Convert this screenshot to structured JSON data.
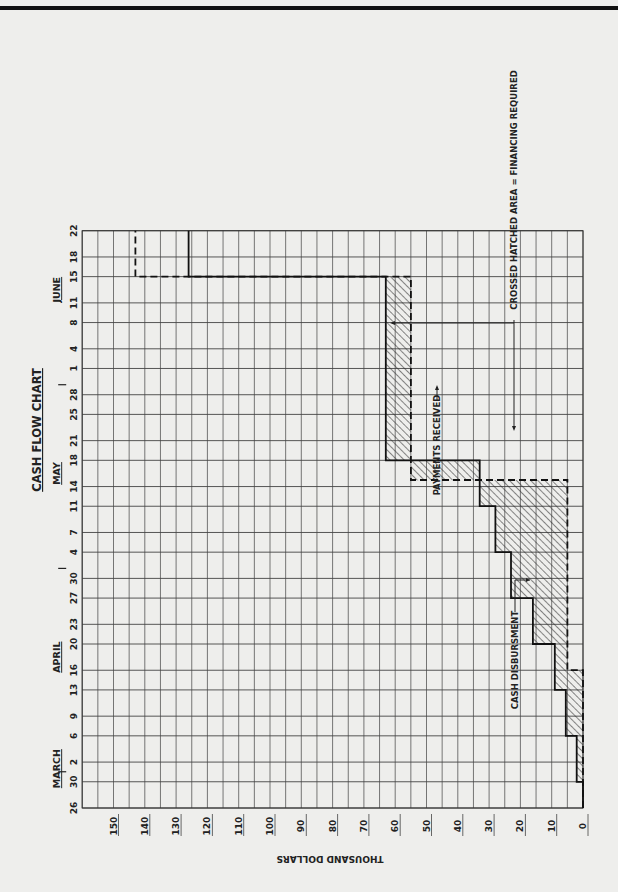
{
  "page": {
    "orientation": "rotated 90 degrees clockwise",
    "background": "#eeeeec",
    "ink": "#222222"
  },
  "chart_data": {
    "type": "line",
    "subtype": "step",
    "title": "CASH FLOW CHART",
    "xlabel": "",
    "ylabel": "THOUSAND DOLLARS",
    "ylim": [
      0,
      160
    ],
    "y_ticks": [
      0,
      10,
      20,
      30,
      40,
      50,
      60,
      70,
      80,
      90,
      100,
      110,
      120,
      130,
      140,
      150
    ],
    "months": [
      {
        "label": "MARCH",
        "near": "Mar 30"
      },
      {
        "label": "APRIL",
        "near": "Apr 16"
      },
      {
        "label": "MAY",
        "near": "May 18"
      },
      {
        "label": "JUNE",
        "near": "Jun 11"
      }
    ],
    "x_ticks": [
      {
        "label": "26",
        "date": "Mar 26",
        "day": 0
      },
      {
        "label": "30",
        "date": "Mar 30",
        "day": 4
      },
      {
        "label": "2",
        "date": "Apr 2",
        "day": 7
      },
      {
        "label": "6",
        "date": "Apr 6",
        "day": 11
      },
      {
        "label": "9",
        "date": "Apr 9",
        "day": 14
      },
      {
        "label": "13",
        "date": "Apr 13",
        "day": 18
      },
      {
        "label": "16",
        "date": "Apr 16",
        "day": 21
      },
      {
        "label": "20",
        "date": "Apr 20",
        "day": 25
      },
      {
        "label": "23",
        "date": "Apr 23",
        "day": 28
      },
      {
        "label": "27",
        "date": "Apr 27",
        "day": 32
      },
      {
        "label": "30",
        "date": "Apr 30",
        "day": 35
      },
      {
        "label": "4",
        "date": "May 4",
        "day": 39
      },
      {
        "label": "7",
        "date": "May 7",
        "day": 42
      },
      {
        "label": "11",
        "date": "May 11",
        "day": 46
      },
      {
        "label": "14",
        "date": "May 14",
        "day": 49
      },
      {
        "label": "18",
        "date": "May 18",
        "day": 53
      },
      {
        "label": "21",
        "date": "May 21",
        "day": 56
      },
      {
        "label": "25",
        "date": "May 25",
        "day": 60
      },
      {
        "label": "28",
        "date": "May 28",
        "day": 63
      },
      {
        "label": "1",
        "date": "Jun 1",
        "day": 67
      },
      {
        "label": "4",
        "date": "Jun 4",
        "day": 70
      },
      {
        "label": "8",
        "date": "Jun 8",
        "day": 74
      },
      {
        "label": "11",
        "date": "Jun 11",
        "day": 77
      },
      {
        "label": "15",
        "date": "Jun 15",
        "day": 81
      },
      {
        "label": "18",
        "date": "Jun 18",
        "day": 84
      },
      {
        "label": "22",
        "date": "Jun 22",
        "day": 88
      }
    ],
    "month_dividers_after": [
      "Mar 30",
      "Apr 30",
      "May 28"
    ],
    "series": [
      {
        "name": "CASH DISBURSMENT",
        "style": "solid",
        "steps": [
          {
            "from": "Mar 26",
            "to": "Mar 30",
            "value": 0
          },
          {
            "from": "Mar 30",
            "to": "Apr 6",
            "value": 2
          },
          {
            "from": "Apr 6",
            "to": "Apr 13",
            "value": 5.5
          },
          {
            "from": "Apr 13",
            "to": "Apr 20",
            "value": 9
          },
          {
            "from": "Apr 20",
            "to": "Apr 27",
            "value": 16
          },
          {
            "from": "Apr 27",
            "to": "May 4",
            "value": 23
          },
          {
            "from": "May 4",
            "to": "May 11",
            "value": 28
          },
          {
            "from": "May 11",
            "to": "May 18",
            "value": 33
          },
          {
            "from": "May 18",
            "to": "Jun 15",
            "value": 63
          },
          {
            "from": "Jun 15",
            "to": "Jun 22",
            "value": 126
          }
        ]
      },
      {
        "name": "PAYMENTS RECEIVED",
        "style": "dashed",
        "steps": [
          {
            "from": "Mar 26",
            "to": "Apr 16",
            "value": 0
          },
          {
            "from": "Apr 16",
            "to": "May 15",
            "value": 5
          },
          {
            "from": "May 15",
            "to": "Jun 15",
            "value": 55
          },
          {
            "from": "Jun 15",
            "to": "Jun 22",
            "value": 143
          }
        ]
      }
    ],
    "annotations": [
      {
        "text": "CASH DISBURSMENT",
        "points_to": "solid step near Apr 23"
      },
      {
        "text": "PAYMENTS RECEIVED",
        "points_to": "dashed step near May 15"
      },
      {
        "text": "CROSSED HATCHED AREA = FINANCING REQUIRED",
        "points_to": [
          "hatched area near May 7",
          "hatched area near May 21"
        ]
      }
    ],
    "hatched_area": "region between disbursement (above) and payments (below) = financing required",
    "grid": true,
    "legend": "none (inline annotations)"
  },
  "labels": {
    "title": "CASH FLOW CHART",
    "yaxis_title": "THOUSAND DOLLARS",
    "annot_disbursement": "CASH DISBURSMENT",
    "annot_payments": "PAYMENTS RECEIVED",
    "annot_hatched": "CROSSED HATCHED AREA = FINANCING REQUIRED"
  }
}
